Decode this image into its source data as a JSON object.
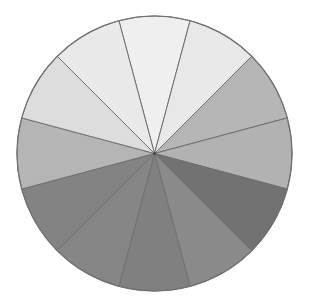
{
  "chart_data": {
    "type": "pie",
    "title": "",
    "legend": [],
    "num_slices": 12,
    "start_angle_deg": -15,
    "direction": "clockwise",
    "center": [
      154.5,
      153.5
    ],
    "radius": 137.5,
    "slices": [
      {
        "value": 1,
        "color": "#efefef"
      },
      {
        "value": 1,
        "color": "#e8e8e8"
      },
      {
        "value": 1,
        "color": "#b6b6b6"
      },
      {
        "value": 1,
        "color": "#b2b2b2"
      },
      {
        "value": 1,
        "color": "#727272"
      },
      {
        "value": 1,
        "color": "#8a8a8a"
      },
      {
        "value": 1,
        "color": "#808080"
      },
      {
        "value": 1,
        "color": "#868686"
      },
      {
        "value": 1,
        "color": "#838383"
      },
      {
        "value": 1,
        "color": "#b5b5b5"
      },
      {
        "value": 1,
        "color": "#dddddd"
      },
      {
        "value": 1,
        "color": "#e9e9e9"
      }
    ],
    "stroke_color": "#707070",
    "background": "#ffffff"
  }
}
